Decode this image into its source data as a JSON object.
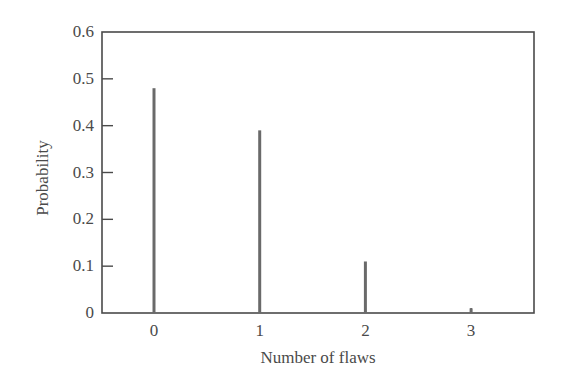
{
  "chart_data": {
    "type": "bar",
    "style": "stem",
    "title": "",
    "xlabel": "Number of flaws",
    "ylabel": "Probability",
    "categories": [
      "0",
      "1",
      "2",
      "3"
    ],
    "x": [
      0,
      1,
      2,
      3
    ],
    "values": [
      0.48,
      0.39,
      0.11,
      0.01
    ],
    "ylim": [
      0,
      0.6
    ],
    "xlim": [
      -0.5,
      3.6
    ],
    "yticks": [
      0,
      0.1,
      0.2,
      0.3,
      0.4,
      0.5,
      0.6
    ],
    "ytick_labels": [
      "0",
      "0.1",
      "0.2",
      "0.3",
      "0.4",
      "0.5",
      "0.6"
    ],
    "xticks": [
      0,
      1,
      2,
      3
    ],
    "xtick_labels": [
      "0",
      "1",
      "2",
      "3"
    ],
    "grid": false,
    "legend": null,
    "colors": {
      "bar": "#6a6a6a",
      "frame": "#4a4a4a"
    }
  }
}
